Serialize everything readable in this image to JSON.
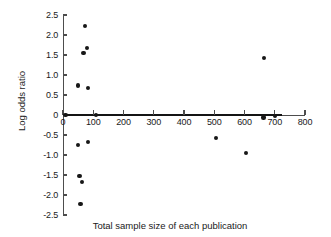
{
  "chart_data": {
    "type": "scatter",
    "title": "",
    "xlabel": "Total sample size of each publication",
    "ylabel": "Log odds ratio",
    "xlim": [
      0,
      800
    ],
    "ylim": [
      -2.5,
      2.5
    ],
    "grid": false,
    "legend": null,
    "xticks": [
      0,
      100,
      200,
      300,
      400,
      500,
      600,
      700,
      800
    ],
    "xtick_labels": [
      "0",
      "100",
      "200",
      "300",
      "400",
      "500",
      "600",
      "700",
      "800"
    ],
    "yticks": [
      2.5,
      2.0,
      1.5,
      1.0,
      0.5,
      0,
      -0.5,
      -1.0,
      -1.5,
      -2.0,
      -2.5
    ],
    "ytick_labels": [
      "2.5",
      "2.0",
      "1.5",
      "1.0",
      "0.5",
      "0",
      "-0.5",
      "-1.0",
      "-1.5",
      "-2.0",
      "-2.5"
    ],
    "reference_line": {
      "y": 0,
      "x_start": 0,
      "x_end": 725,
      "style": "solid-thick"
    },
    "marker": {
      "shape": "circle",
      "color": "#171717",
      "size": 4.4
    },
    "points": [
      {
        "x": 72,
        "y": 2.22
      },
      {
        "x": 80,
        "y": 1.68
      },
      {
        "x": 68,
        "y": 1.55
      },
      {
        "x": 665,
        "y": 1.43
      },
      {
        "x": 50,
        "y": 0.74
      },
      {
        "x": 82,
        "y": 0.67
      },
      {
        "x": 8,
        "y": 0.0
      },
      {
        "x": 110,
        "y": 0.0
      },
      {
        "x": 663,
        "y": -0.06
      },
      {
        "x": 700,
        "y": -0.03
      },
      {
        "x": 505,
        "y": -0.58
      },
      {
        "x": 82,
        "y": -0.67
      },
      {
        "x": 50,
        "y": -0.75
      },
      {
        "x": 605,
        "y": -0.95
      },
      {
        "x": 55,
        "y": -1.53
      },
      {
        "x": 62,
        "y": -1.68
      },
      {
        "x": 58,
        "y": -2.22
      }
    ]
  }
}
